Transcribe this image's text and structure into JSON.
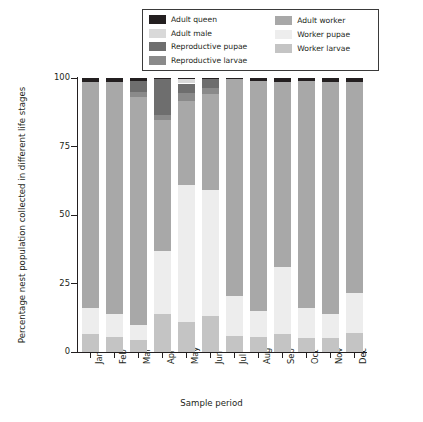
{
  "chart_data": {
    "type": "bar",
    "stacked": true,
    "title": "",
    "xlabel": "Sample period",
    "ylabel": "Percentage nest population collected in different life stages",
    "categories": [
      "Jan",
      "Feb",
      "Mar",
      "Apr",
      "May",
      "Jun",
      "Jul",
      "Aug",
      "Sep",
      "Oct",
      "Nov",
      "Dec"
    ],
    "ylim": [
      0,
      100
    ],
    "yticks": [
      0,
      25,
      50,
      75,
      100
    ],
    "ytick_labels": [
      "0",
      "25",
      "50",
      "75",
      "100"
    ],
    "grid": false,
    "legend_position": "top-center",
    "series": [
      {
        "name": "Adult queen",
        "color": "#231f20",
        "values": [
          1.5,
          1.5,
          1.0,
          0.5,
          0.5,
          0.5,
          0.5,
          1.0,
          1.5,
          1.0,
          1.5,
          1.5
        ]
      },
      {
        "name": "Adult male",
        "color": "#d9d9d9",
        "values": [
          0,
          0,
          0,
          0,
          1.5,
          0,
          0,
          0,
          0,
          0,
          0,
          0
        ]
      },
      {
        "name": "Reproductive pupae",
        "color": "#6e6e6e",
        "values": [
          0,
          0,
          4.0,
          13.0,
          3.5,
          3.0,
          0,
          0,
          0,
          0,
          0,
          0
        ]
      },
      {
        "name": "Reproductive larvae",
        "color": "#8a8a8a",
        "values": [
          0,
          0,
          2.0,
          2.0,
          3.0,
          2.5,
          0,
          0,
          0,
          0,
          0,
          0
        ]
      },
      {
        "name": "Adult worker",
        "color": "#a8a8a8",
        "values": [
          82.5,
          84.5,
          83.0,
          47.5,
          30.5,
          35.0,
          79.0,
          84.0,
          67.5,
          83.0,
          84.5,
          77.0
        ]
      },
      {
        "name": "Worker pupae",
        "color": "#ededed",
        "values": [
          9.5,
          8.5,
          5.5,
          23.0,
          50.0,
          46.0,
          14.5,
          9.5,
          24.5,
          11.0,
          9.0,
          14.5
        ]
      },
      {
        "name": "Worker larvae",
        "color": "#c4c4c4",
        "values": [
          6.5,
          5.5,
          4.5,
          14.0,
          11.0,
          13.0,
          6.0,
          5.5,
          6.5,
          5.0,
          5.0,
          7.0
        ]
      }
    ]
  },
  "legend": {
    "entries": [
      {
        "label": "Adult queen",
        "color": "#231f20"
      },
      {
        "label": "Adult male",
        "color": "#d9d9d9"
      },
      {
        "label": "Reproductive pupae",
        "color": "#6e6e6e"
      },
      {
        "label": "Reproductive larvae",
        "color": "#8a8a8a"
      },
      {
        "label": "Adult worker",
        "color": "#a8a8a8"
      },
      {
        "label": "Worker pupae",
        "color": "#ededed"
      },
      {
        "label": "Worker larvae",
        "color": "#c4c4c4"
      }
    ]
  }
}
